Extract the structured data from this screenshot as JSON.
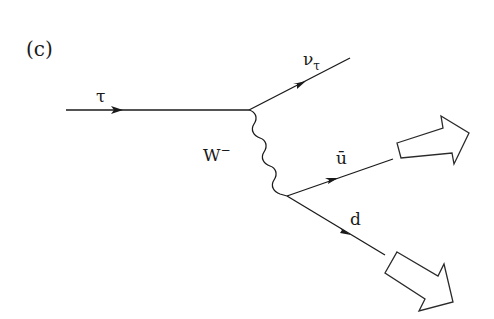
{
  "diagram": {
    "panel_label": "(c)",
    "type": "Feynman diagram - tau lepton hadronic decay",
    "particles": {
      "incoming": {
        "symbol": "τ",
        "label": "τ"
      },
      "outgoing_neutrino": {
        "symbol": "ν",
        "subscript": "τ",
        "label": "ν_τ"
      },
      "boson": {
        "symbol": "W",
        "superscript": "−",
        "label": "W⁻"
      },
      "antiquark": {
        "symbol": "ū",
        "label": "ū"
      },
      "quark": {
        "symbol": "d",
        "label": "d"
      }
    },
    "jets": [
      {
        "name": "jet-from-antiquark",
        "direction": "upper-right"
      },
      {
        "name": "jet-from-quark",
        "direction": "lower-right"
      }
    ],
    "line_color": "#1a1a1a",
    "background": "#ffffff"
  }
}
